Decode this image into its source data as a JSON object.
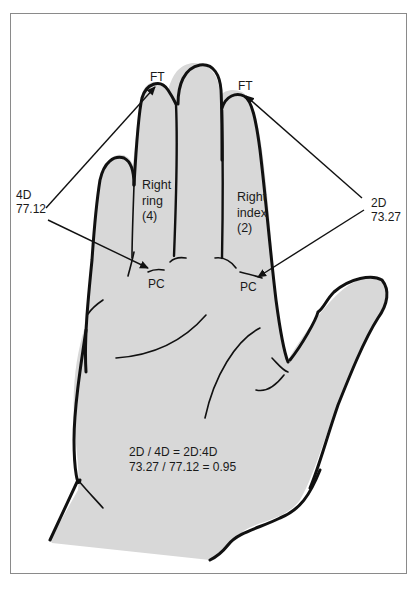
{
  "diagram": {
    "colors": {
      "hand_fill": "#d8d8d8",
      "outline": "#111111",
      "frame": "#8a8a8a",
      "background": "#ffffff"
    },
    "fingers": {
      "ring": {
        "line1": "Right",
        "line2": "ring",
        "line3": "(4)"
      },
      "index": {
        "line1": "Right",
        "line2": "index",
        "line3": "(2)"
      }
    },
    "landmarks": {
      "ring_tip": "FT",
      "index_tip": "FT",
      "ring_crease": "PC",
      "index_crease": "PC"
    },
    "measurements": {
      "ring": {
        "label": "4D",
        "value": "77.12"
      },
      "index": {
        "label": "2D",
        "value": "73.27"
      }
    },
    "formula": {
      "line1": "2D / 4D = 2D:4D",
      "line2": "73.27 / 77.12 = 0.95"
    }
  }
}
